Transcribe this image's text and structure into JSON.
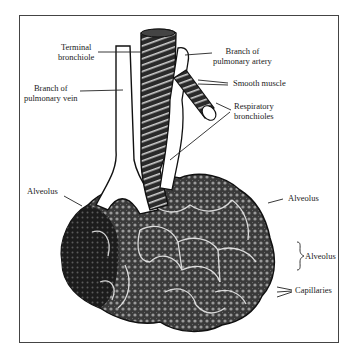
{
  "diagram": {
    "labels": {
      "terminal_bronchiole": [
        "Terminal",
        "bronchiole"
      ],
      "branch_pulmonary_artery": [
        "Branch of",
        "pulmonary artery"
      ],
      "smooth_muscle": "Smooth muscle",
      "branch_pulmonary_vein": [
        "Branch of",
        "pulmonary vein"
      ],
      "respiratory_bronchioles": [
        "Respiratory",
        "bronchioles"
      ],
      "alveolus_left": "Alveolus",
      "alveolus_right": "Alveolus",
      "alveolus_bracket": "Alveolus",
      "capillaries": "Capillaries"
    },
    "colors": {
      "ink": "#1e1e1e",
      "paper": "#ffffff",
      "frame": "#444444"
    }
  }
}
